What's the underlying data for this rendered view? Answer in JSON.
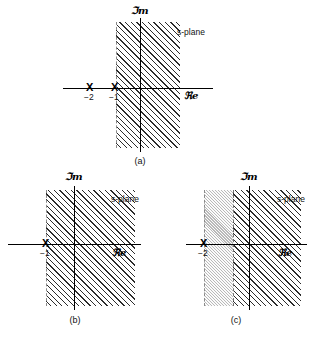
{
  "figure": {
    "type": "s-plane region-of-convergence diagrams",
    "panel_count": 3
  },
  "labels": {
    "imaginary_axis": "ℑm",
    "real_axis": "ℜe",
    "plane_annotation": "s-plane",
    "pole_marker": "X",
    "tick_minus_one": "−1",
    "tick_minus_two": "−2"
  },
  "panels": [
    {
      "id": "a",
      "caption": "(a)",
      "plane_label": "s-plane",
      "imaginary_label": "ℑm",
      "real_label": "ℜe",
      "poles": [
        {
          "marker": "X",
          "value": "−2"
        },
        {
          "marker": "X",
          "value": "−1"
        }
      ],
      "regions": [
        {
          "style": "hatched",
          "boundary": "−1",
          "direction": "right"
        }
      ]
    },
    {
      "id": "b",
      "caption": "(b)",
      "plane_label": "s-plane",
      "imaginary_label": "ℑm",
      "real_label": "ℜe",
      "poles": [
        {
          "marker": "X",
          "value": "−1"
        }
      ],
      "regions": [
        {
          "style": "hatched",
          "boundary": "−1",
          "direction": "right"
        }
      ]
    },
    {
      "id": "c",
      "caption": "(c)",
      "plane_label": "s-plane",
      "imaginary_label": "ℑm",
      "real_label": "ℜe",
      "poles": [
        {
          "marker": "X",
          "value": "−2"
        }
      ],
      "regions": [
        {
          "style": "stippled",
          "boundary": "−2",
          "direction": "right"
        },
        {
          "style": "hatched",
          "boundary": "−1",
          "direction": "right"
        }
      ]
    }
  ],
  "colors": {
    "hatch_dark": "#2b2b2b",
    "hatch_light": "#b9b9b9",
    "axis": "#000000",
    "background": "#ffffff"
  }
}
